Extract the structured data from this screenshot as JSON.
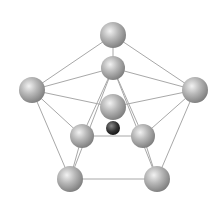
{
  "diagram": {
    "type": "molecular-cluster",
    "background": "#ffffff",
    "bond_color": "#a8a8a8",
    "atom_light_color": "#f2f2f2",
    "atom_mid_color": "#b8b8b8",
    "atom_shadow_color": "#7a7a7a",
    "central_atom_color": "#333333",
    "atoms": [
      {
        "id": "top",
        "x": 113,
        "y": 35,
        "r": 13,
        "kind": "outer"
      },
      {
        "id": "upper-mid",
        "x": 113,
        "y": 68,
        "r": 12,
        "kind": "outer"
      },
      {
        "id": "left",
        "x": 32,
        "y": 90,
        "r": 13,
        "kind": "outer"
      },
      {
        "id": "right",
        "x": 195,
        "y": 90,
        "r": 13,
        "kind": "outer"
      },
      {
        "id": "center",
        "x": 113,
        "y": 107,
        "r": 13,
        "kind": "outer"
      },
      {
        "id": "inner-left",
        "x": 82,
        "y": 136,
        "r": 12,
        "kind": "outer"
      },
      {
        "id": "inner-right",
        "x": 143,
        "y": 136,
        "r": 12,
        "kind": "outer"
      },
      {
        "id": "bottom-left",
        "x": 70,
        "y": 179,
        "r": 13,
        "kind": "outer"
      },
      {
        "id": "bottom-right",
        "x": 157,
        "y": 179,
        "r": 13,
        "kind": "outer"
      },
      {
        "id": "core",
        "x": 113,
        "y": 128,
        "r": 7,
        "kind": "core"
      }
    ],
    "bonds": [
      [
        "top",
        "left"
      ],
      [
        "top",
        "right"
      ],
      [
        "top",
        "upper-mid"
      ],
      [
        "upper-mid",
        "left"
      ],
      [
        "upper-mid",
        "right"
      ],
      [
        "upper-mid",
        "inner-left"
      ],
      [
        "upper-mid",
        "inner-right"
      ],
      [
        "left",
        "center"
      ],
      [
        "right",
        "center"
      ],
      [
        "left",
        "inner-left"
      ],
      [
        "left",
        "bottom-left"
      ],
      [
        "right",
        "inner-right"
      ],
      [
        "right",
        "bottom-right"
      ],
      [
        "inner-left",
        "inner-right"
      ],
      [
        "inner-left",
        "bottom-left"
      ],
      [
        "inner-right",
        "bottom-right"
      ],
      [
        "upper-mid",
        "bottom-left"
      ],
      [
        "upper-mid",
        "bottom-right"
      ],
      [
        "bottom-left",
        "bottom-right"
      ]
    ]
  }
}
